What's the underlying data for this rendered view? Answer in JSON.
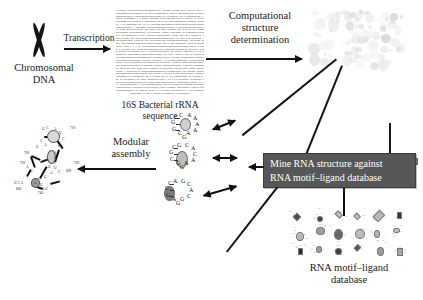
{
  "figure": {
    "type": "workflow-diagram",
    "background": "#ffffff",
    "accent_box_color": "#575757",
    "accent_text_color": "#ffffff"
  },
  "nodes": {
    "chromosome": {
      "label_line1": "Chromosomal",
      "label_line2": "DNA",
      "icon": "chromosome-x-icon"
    },
    "sequence": {
      "label_line1": "16S Bacterial rRNA",
      "label_line2": "sequence",
      "icon": "sequence-text-block"
    },
    "structure3d": {
      "icon": "ribosome-3d-structure"
    },
    "modular_rna": {
      "icon": "rna-secondary-structure"
    },
    "database": {
      "label_line1": "RNA motif–ligand",
      "label_line2": "database",
      "icon": "motif-grid-icon"
    },
    "minebox": {
      "line1": "Mine RNA structure against",
      "line2": "RNA motif–ligand database"
    }
  },
  "arrows": {
    "transcription": {
      "label": "Transcription"
    },
    "computational": {
      "label_line1": "Computational",
      "label_line2": "structure",
      "label_line3": "determination"
    },
    "modular": {
      "label_line1": "Modular",
      "label_line2": "assembly"
    }
  },
  "motifs": [
    {
      "id": "motif-top",
      "loop": [
        "C",
        "A",
        "A",
        "A",
        "A",
        "A",
        "C",
        "G",
        "G"
      ],
      "stem": [
        "C",
        "G"
      ],
      "oval_fill": "#cfcfcf"
    },
    {
      "id": "motif-middle",
      "loop": [
        "G",
        "C",
        "A",
        "C",
        "A",
        "A",
        "G",
        "C",
        "G"
      ],
      "stem": [
        "C",
        "G"
      ],
      "oval_fill": "#bdbdbd"
    },
    {
      "id": "motif-bottom",
      "loop": [
        "A",
        "G",
        "C",
        "A",
        "C",
        "G",
        "A",
        "G",
        "C"
      ],
      "stem": [
        "C",
        "G"
      ],
      "oval_fill": "#7d7d7d"
    }
  ],
  "rna_structure_labels": {
    "positions": [
      "710",
      "700",
      "690",
      "680",
      "730",
      "720",
      "740"
    ],
    "bases": [
      "G",
      "C",
      "A",
      "U",
      "C",
      "G",
      "A",
      "G",
      "C",
      "U",
      "A",
      "G",
      "C",
      "A",
      "U"
    ],
    "extra": [
      "G C A",
      "A G"
    ]
  },
  "sequence_block": {
    "lines": 31,
    "sample": "augcuagcgauacgguacgauucgaugcauacggaucgauuacgcaugcaucgauacggcaucgauacggcaucg"
  }
}
